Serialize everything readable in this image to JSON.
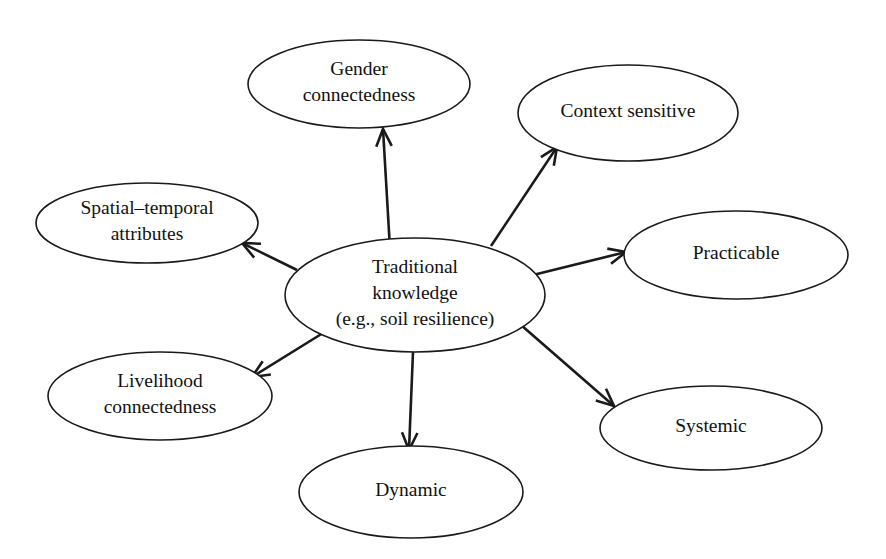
{
  "diagram": {
    "type": "concept-map",
    "background_color": "#ffffff",
    "stroke_color": "#1a1a1a",
    "text_color": "#111111",
    "central_node": {
      "id": "traditional-knowledge",
      "line1": "Traditional",
      "line2": "knowledge",
      "line3": "(e.g., soil resilience)",
      "cx": 415,
      "cy": 295,
      "rx": 130,
      "ry": 57
    },
    "satellites": [
      {
        "id": "gender-connectedness",
        "line1": "Gender",
        "line2": "connectedness",
        "cx": 359,
        "cy": 84,
        "rx": 111,
        "ry": 44
      },
      {
        "id": "context-sensitive",
        "line1": "Context sensitive",
        "line2": "",
        "cx": 628,
        "cy": 113,
        "rx": 110,
        "ry": 48
      },
      {
        "id": "practicable",
        "line1": "Practicable",
        "line2": "",
        "cx": 736,
        "cy": 255,
        "rx": 112,
        "ry": 44
      },
      {
        "id": "systemic",
        "line1": "Systemic",
        "line2": "",
        "cx": 711,
        "cy": 428,
        "rx": 111,
        "ry": 42
      },
      {
        "id": "dynamic",
        "line1": "Dynamic",
        "line2": "",
        "cx": 411,
        "cy": 492,
        "rx": 112,
        "ry": 46
      },
      {
        "id": "livelihood-connectedness",
        "line1": "Livelihood",
        "line2": "connectedness",
        "cx": 160,
        "cy": 396,
        "rx": 112,
        "ry": 44
      },
      {
        "id": "spatial-temporal-attributes",
        "line1": "Spatial–temporal",
        "line2": "attributes",
        "cx": 147,
        "cy": 223,
        "rx": 111,
        "ry": 40
      }
    ],
    "arrows": [
      {
        "id": "arrow-to-gender-connectedness",
        "from": "traditional-knowledge",
        "to": "gender-connectedness",
        "x1": 390,
        "y1": 249,
        "x2": 383,
        "y2": 129
      },
      {
        "id": "arrow-to-context-sensitive",
        "from": "traditional-knowledge",
        "to": "context-sensitive",
        "x1": 491,
        "y1": 246,
        "x2": 557,
        "y2": 147
      },
      {
        "id": "arrow-to-practicable",
        "from": "traditional-knowledge",
        "to": "practicable",
        "x1": 533,
        "y1": 275,
        "x2": 626,
        "y2": 252
      },
      {
        "id": "arrow-to-systemic",
        "from": "traditional-knowledge",
        "to": "systemic",
        "x1": 521,
        "y1": 325,
        "x2": 614,
        "y2": 406
      },
      {
        "id": "arrow-to-dynamic",
        "from": "traditional-knowledge",
        "to": "dynamic",
        "x1": 413,
        "y1": 352,
        "x2": 409,
        "y2": 450
      },
      {
        "id": "arrow-to-livelihood-connectedness",
        "from": "traditional-knowledge",
        "to": "livelihood-connectedness",
        "x1": 323,
        "y1": 333,
        "x2": 252,
        "y2": 377
      },
      {
        "id": "arrow-to-spatial-temporal-attributes",
        "from": "traditional-knowledge",
        "to": "spatial-temporal-attributes",
        "x1": 297,
        "y1": 270,
        "x2": 242,
        "y2": 243
      }
    ]
  }
}
